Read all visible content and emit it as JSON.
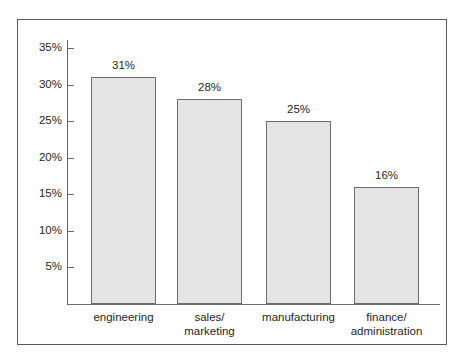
{
  "chart_data": {
    "type": "bar",
    "title": "",
    "subtitle": "",
    "xlabel": "",
    "ylabel": "",
    "categories": [
      "engineering",
      "sales/\nmarketing",
      "manufacturing",
      "finance/\nadministration"
    ],
    "category_lines": [
      [
        "engineering"
      ],
      [
        "sales/",
        "marketing"
      ],
      [
        "manufacturing"
      ],
      [
        "finance/",
        "administration"
      ]
    ],
    "values": [
      31,
      28,
      25,
      16
    ],
    "value_labels": [
      "31%",
      "28%",
      "25%",
      "16%"
    ],
    "ylim": [
      0,
      36.5
    ],
    "yticks": [
      5,
      10,
      15,
      20,
      25,
      30,
      35
    ],
    "ytick_labels": [
      "5%",
      "10%",
      "15%",
      "20%",
      "25%",
      "30%",
      "35%"
    ],
    "grid": false,
    "legend": false,
    "legend_position": "none",
    "bar_fill_color": "#e4e4e4",
    "bar_border_color": "#6d6d6d",
    "axis_color": "#6a6a6a",
    "frame_color": "#5d5d5d",
    "text_color": "#1f1f1f",
    "background_color": "#ffffff"
  }
}
